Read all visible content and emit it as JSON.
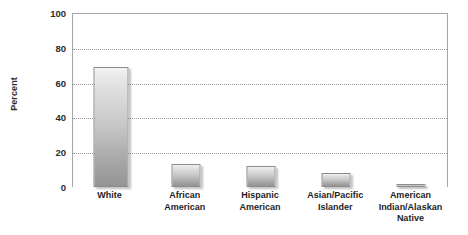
{
  "chart_data": {
    "type": "bar",
    "title": "",
    "xlabel": "",
    "ylabel": "Percent",
    "ylim": [
      0,
      100
    ],
    "yticks": [
      0,
      20,
      40,
      60,
      80,
      100
    ],
    "grid": true,
    "legend": false,
    "categories": [
      "White",
      "African American",
      "Hispanic American",
      "Asian/Pacific Islander",
      "American Indian/Alaskan Native"
    ],
    "category_labels_wrapped": [
      "White",
      "African\nAmerican",
      "Hispanic\nAmerican",
      "Asian/Pacific\nIslander",
      "American\nIndian/Alaskan\nNative"
    ],
    "values": [
      69,
      13,
      12,
      8,
      1
    ],
    "bar_color": "#c8c8c8",
    "bar_border_color": "#8d8d8d",
    "axis_color": "#a6a6a6",
    "gridline_color": "#9a9a9a",
    "text_color": "#1e1e1e"
  },
  "axis": {
    "y_title": "Percent",
    "y_tick_labels": [
      "100",
      "80",
      "60",
      "40",
      "20",
      "0"
    ]
  }
}
